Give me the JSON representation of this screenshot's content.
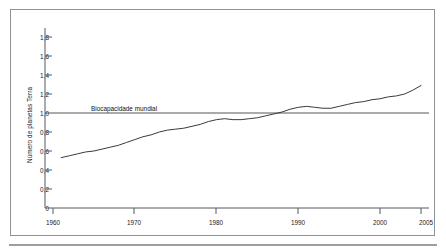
{
  "figure": {
    "background": "#ffffff",
    "border_color": "#8f9296",
    "rule_color": "#9a9da1"
  },
  "chart_data": {
    "type": "line",
    "title": "",
    "subtitle": "",
    "xlabel": "",
    "ylabel": "Número de planetas Terra",
    "xlim": [
      1960,
      2005
    ],
    "ylim": [
      0,
      1.8
    ],
    "grid": false,
    "legend_position": "inline-annotation",
    "xticks": [
      1960,
      1970,
      1980,
      1990,
      2000,
      2005
    ],
    "xtick_labels": [
      "1960",
      "1970",
      "1980",
      "1990",
      "2000",
      "2005"
    ],
    "yticks": [
      0,
      0.2,
      0.4,
      0.6,
      0.8,
      1.0,
      1.2,
      1.4,
      1.6,
      1.8
    ],
    "ytick_labels": [
      "0",
      "0,2",
      "0,4",
      "0,6",
      "0,8",
      "1,0",
      "1,2",
      "1,4",
      "1,6",
      "1,8"
    ],
    "annotations": [
      {
        "text": "Biocapacidade mundial",
        "x": 1968,
        "y": 1.0,
        "kind": "reference-line-label"
      }
    ],
    "reference_lines": [
      {
        "name": "Biocapacidade mundial",
        "orientation": "horizontal",
        "y": 1.0,
        "color": "#444444"
      }
    ],
    "series": [
      {
        "name": "Pegada ecológica da humanidade",
        "color": "#3a3a3a",
        "x": [
          1961,
          1962,
          1963,
          1964,
          1965,
          1966,
          1967,
          1968,
          1969,
          1970,
          1971,
          1972,
          1973,
          1974,
          1975,
          1976,
          1977,
          1978,
          1979,
          1980,
          1981,
          1982,
          1983,
          1984,
          1985,
          1986,
          1987,
          1988,
          1989,
          1990,
          1991,
          1992,
          1993,
          1994,
          1995,
          1996,
          1997,
          1998,
          1999,
          2000,
          2001,
          2002,
          2003,
          2004,
          2005
        ],
        "values": [
          0.53,
          0.55,
          0.57,
          0.59,
          0.6,
          0.62,
          0.64,
          0.66,
          0.69,
          0.72,
          0.75,
          0.77,
          0.8,
          0.82,
          0.83,
          0.84,
          0.86,
          0.88,
          0.91,
          0.93,
          0.94,
          0.93,
          0.93,
          0.94,
          0.95,
          0.97,
          0.99,
          1.01,
          1.04,
          1.06,
          1.07,
          1.06,
          1.05,
          1.05,
          1.07,
          1.09,
          1.11,
          1.12,
          1.14,
          1.15,
          1.17,
          1.18,
          1.2,
          1.24,
          1.29
        ]
      }
    ]
  }
}
